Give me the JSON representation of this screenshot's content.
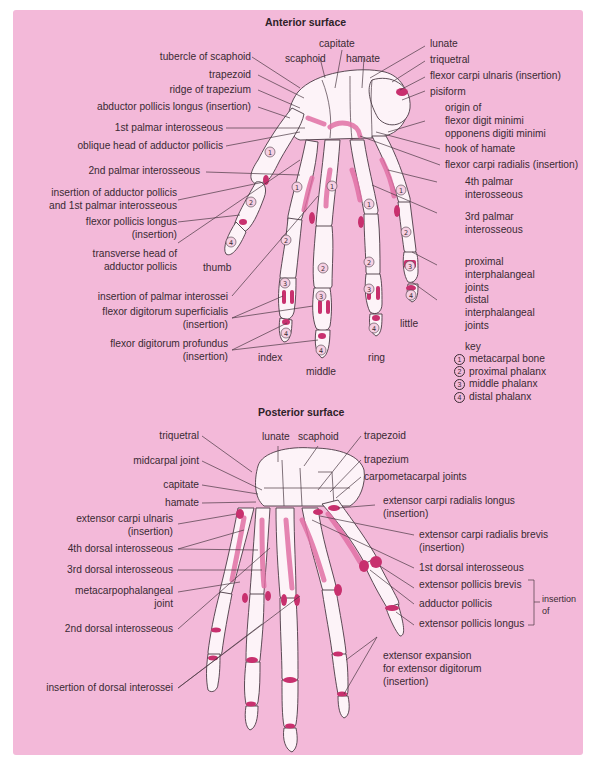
{
  "colors": {
    "background": "#f3b9d9",
    "bone_fill": "#fdf3f8",
    "bone_outline": "#4a3a44",
    "attachment": "#c8306e",
    "attachment_light": "#e070a4",
    "label_text": "#3a2a33"
  },
  "anterior": {
    "title": "Anterior surface",
    "labels_left": [
      "tubercle of  scaphoid",
      "trapezoid",
      "ridge of trapezium",
      "abductor pollicis longus (insertion)",
      "1st palmar interosseous",
      "oblique head of adductor pollicis",
      "2nd palmar interosseous",
      "insertion of adductor pollicis",
      "and 1st palmar interosseous",
      "flexor pollicis longus",
      "(insertion)",
      "transverse head of",
      "adductor pollicis",
      "insertion of palmar interossei",
      "flexor digitorum superficialis",
      "(insertion)",
      "flexor digitorum profundus",
      "(insertion)"
    ],
    "labels_top": [
      "capitate",
      "scaphoid",
      "hamate"
    ],
    "labels_right": [
      "lunate",
      "triquetral",
      "flexor carpi ulnaris (insertion)",
      "pisiform",
      "origin of",
      "flexor digit minimi",
      "opponens digiti minimi",
      "hook of hamate",
      "flexor carpi radialis (insertion)",
      "4th palmar",
      "interosseous",
      "3rd palmar",
      "interosseous",
      "proximal",
      "interphalangeal",
      "joints",
      "distal",
      "interphalangeal",
      "joints"
    ],
    "digits": [
      "thumb",
      "index",
      "middle",
      "ring",
      "little"
    ]
  },
  "key": {
    "title": "key",
    "items": [
      {
        "num": "1",
        "label": "metacarpal bone"
      },
      {
        "num": "2",
        "label": "proximal phalanx"
      },
      {
        "num": "3",
        "label": "middle phalanx"
      },
      {
        "num": "4",
        "label": "distal phalanx"
      }
    ]
  },
  "posterior": {
    "title": "Posterior surface",
    "labels_left": [
      "triquetral",
      "midcarpal joint",
      "capitate",
      "hamate",
      "extensor carpi ulnaris",
      "(insertion)",
      "4th dorsal interosseous",
      "3rd dorsal interosseous",
      "metacarpophalangeal",
      "joint",
      "2nd dorsal interosseous",
      "insertion of dorsal interossei"
    ],
    "labels_top": [
      "lunate",
      "scaphoid"
    ],
    "labels_right": [
      "trapezoid",
      "trapezium",
      "carpometacarpal joints",
      "extensor carpi radialis longus",
      "(insertion)",
      "extensor carpi radialis brevis",
      "(insertion)",
      "1st dorsal interosseous",
      "extensor pollicis brevis",
      "adductor pollicis",
      "extensor pollicis longus",
      "extensor expansion",
      "for extensor digitorum",
      "(insertion)"
    ],
    "bracket_label": [
      "insertion",
      "of"
    ]
  }
}
